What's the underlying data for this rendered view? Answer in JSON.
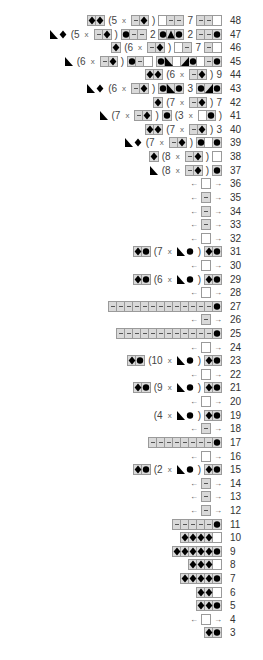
{
  "chart": {
    "symbols": {
      "K": "blank (knit)",
      "P": "dash (purl)",
      "D": "diamond",
      "O": "dot",
      "L": "triangle-left (lower-left black)",
      "R": "triangle-right (lower-right black)",
      "T": "triangle-up"
    },
    "rows": [
      {
        "n": "48",
        "parts": [
          {
            "g": "DD"
          },
          {
            "t": "(5"
          },
          {
            "x": "x"
          },
          {
            "g": "PD"
          },
          {
            "t": ")"
          },
          {
            "g": "KPP"
          },
          {
            "t": "7"
          },
          {
            "g": "PPK"
          }
        ]
      },
      {
        "n": "47",
        "parts": [
          {
            "g": "LD",
            "plain": true
          },
          {
            "t": "(5"
          },
          {
            "x": "x"
          },
          {
            "g": "PD"
          },
          {
            "t": ")"
          },
          {
            "g": "OPP"
          },
          {
            "t": "2"
          },
          {
            "g": "OTO"
          },
          {
            "t": "2"
          },
          {
            "g": "PPO"
          }
        ]
      },
      {
        "n": "46",
        "parts": [
          {
            "g": "D"
          },
          {
            "t": "(6"
          },
          {
            "x": "x"
          },
          {
            "g": "PD"
          },
          {
            "t": ")"
          },
          {
            "g": "KP"
          },
          {
            "t": "7"
          },
          {
            "g": "PK"
          }
        ]
      },
      {
        "n": "45",
        "parts": [
          {
            "g": "L",
            "plain": true
          },
          {
            "t": "(6"
          },
          {
            "x": "x"
          },
          {
            "g": "PD"
          },
          {
            "t": ")"
          },
          {
            "g": "OPK"
          },
          {
            "g": "OLKROKPO"
          }
        ]
      },
      {
        "n": "44",
        "parts": [
          {
            "g": "DD"
          },
          {
            "t": "(6"
          },
          {
            "x": "x"
          },
          {
            "g": "PD"
          },
          {
            "t": ")"
          },
          {
            "t": "9"
          }
        ]
      },
      {
        "n": "43",
        "parts": [
          {
            "g": "LD",
            "plain": true
          },
          {
            "t": "(6"
          },
          {
            "x": "x"
          },
          {
            "g": "PD"
          },
          {
            "t": ")"
          },
          {
            "g": "OLO"
          },
          {
            "t": "3"
          },
          {
            "g": "ORO"
          }
        ]
      },
      {
        "n": "42",
        "parts": [
          {
            "g": "D"
          },
          {
            "t": "(7"
          },
          {
            "x": "x"
          },
          {
            "g": "PD"
          },
          {
            "t": ")"
          },
          {
            "t": "7"
          }
        ]
      },
      {
        "n": "41",
        "parts": [
          {
            "g": "L",
            "plain": true
          },
          {
            "t": "(7"
          },
          {
            "x": "x"
          },
          {
            "g": "PD"
          },
          {
            "t": ")"
          },
          {
            "g": "O"
          },
          {
            "t": "(3"
          },
          {
            "x": "x"
          },
          {
            "g": "KO"
          },
          {
            "t": ")"
          }
        ]
      },
      {
        "n": "40",
        "parts": [
          {
            "g": "DD"
          },
          {
            "t": "(7"
          },
          {
            "x": "x"
          },
          {
            "g": "PD"
          },
          {
            "t": ")"
          },
          {
            "t": "3"
          }
        ]
      },
      {
        "n": "39",
        "parts": [
          {
            "g": "LD",
            "plain": true
          },
          {
            "t": "(7"
          },
          {
            "x": "x"
          },
          {
            "g": "PD"
          },
          {
            "t": ")"
          },
          {
            "g": "OKO"
          }
        ]
      },
      {
        "n": "38",
        "parts": [
          {
            "g": "D"
          },
          {
            "t": "(8"
          },
          {
            "x": "x"
          },
          {
            "g": "PD"
          },
          {
            "t": ")"
          },
          {
            "g": "K"
          }
        ]
      },
      {
        "n": "37",
        "parts": [
          {
            "g": "L",
            "plain": true
          },
          {
            "t": "(8"
          },
          {
            "x": "x"
          },
          {
            "g": "PD"
          },
          {
            "t": ")"
          },
          {
            "g": "O"
          }
        ]
      },
      {
        "n": "36",
        "parts": [
          {
            "a": "←"
          },
          {
            "g": "K"
          },
          {
            "a": "→"
          }
        ]
      },
      {
        "n": "35",
        "parts": [
          {
            "a": "←"
          },
          {
            "g": "P"
          },
          {
            "a": "→"
          }
        ]
      },
      {
        "n": "34",
        "parts": [
          {
            "a": "←"
          },
          {
            "g": "P"
          },
          {
            "a": "→"
          }
        ]
      },
      {
        "n": "33",
        "parts": [
          {
            "a": "←"
          },
          {
            "g": "P"
          },
          {
            "a": "→"
          }
        ]
      },
      {
        "n": "32",
        "parts": [
          {
            "a": "←"
          },
          {
            "g": "K"
          },
          {
            "a": "→"
          }
        ]
      },
      {
        "n": "31",
        "parts": [
          {
            "g": "DO"
          },
          {
            "t": "(7"
          },
          {
            "x": "x"
          },
          {
            "g": "LO",
            "plain": true
          },
          {
            "t": ")"
          },
          {
            "g": "DO"
          }
        ]
      },
      {
        "n": "30",
        "parts": [
          {
            "a": "←"
          },
          {
            "g": "K"
          },
          {
            "a": "→"
          }
        ]
      },
      {
        "n": "29",
        "parts": [
          {
            "g": "DO"
          },
          {
            "t": "(6"
          },
          {
            "x": "x"
          },
          {
            "g": "LO",
            "plain": true
          },
          {
            "t": ")"
          },
          {
            "g": "DO"
          }
        ]
      },
      {
        "n": "28",
        "parts": [
          {
            "a": "←"
          },
          {
            "g": "K"
          },
          {
            "a": "→"
          }
        ]
      },
      {
        "n": "27",
        "parts": [
          {
            "g": "PPPPPPPPPPPPPO"
          }
        ]
      },
      {
        "n": "26",
        "parts": [
          {
            "a": "←"
          },
          {
            "g": "P"
          },
          {
            "a": "→"
          }
        ]
      },
      {
        "n": "25",
        "parts": [
          {
            "g": "PPPPPPPPPPPPO"
          }
        ]
      },
      {
        "n": "24",
        "parts": [
          {
            "a": "←"
          },
          {
            "g": "K"
          },
          {
            "a": "→"
          }
        ]
      },
      {
        "n": "23",
        "parts": [
          {
            "g": "DO"
          },
          {
            "t": "(10"
          },
          {
            "x": "x"
          },
          {
            "g": "LO",
            "plain": true
          },
          {
            "t": ")"
          },
          {
            "g": "DO"
          }
        ]
      },
      {
        "n": "22",
        "parts": [
          {
            "a": "←"
          },
          {
            "g": "K"
          },
          {
            "a": "→"
          }
        ]
      },
      {
        "n": "21",
        "parts": [
          {
            "g": "DO"
          },
          {
            "t": "(9"
          },
          {
            "x": "x"
          },
          {
            "g": "LO",
            "plain": true
          },
          {
            "t": ")"
          },
          {
            "g": "DO"
          }
        ]
      },
      {
        "n": "20",
        "parts": [
          {
            "a": "←"
          },
          {
            "g": "K"
          },
          {
            "a": "→"
          }
        ]
      },
      {
        "n": "19",
        "parts": [
          {
            "t": "(4"
          },
          {
            "x": "x"
          },
          {
            "g": "LO",
            "plain": true
          },
          {
            "t": ")"
          },
          {
            "g": "DO"
          }
        ]
      },
      {
        "n": "18",
        "parts": [
          {
            "a": "←"
          },
          {
            "g": "P"
          },
          {
            "a": "→"
          }
        ]
      },
      {
        "n": "17",
        "parts": [
          {
            "g": "PPPPPPPPO"
          }
        ]
      },
      {
        "n": "16",
        "parts": [
          {
            "a": "←"
          },
          {
            "g": "K"
          },
          {
            "a": "→"
          }
        ]
      },
      {
        "n": "15",
        "parts": [
          {
            "g": "DO"
          },
          {
            "t": "(2"
          },
          {
            "x": "x"
          },
          {
            "g": "LO",
            "plain": true
          },
          {
            "t": ")"
          },
          {
            "g": "DO"
          }
        ]
      },
      {
        "n": "14",
        "parts": [
          {
            "a": "←"
          },
          {
            "g": "P"
          },
          {
            "a": "→"
          }
        ]
      },
      {
        "n": "13",
        "parts": [
          {
            "a": "←"
          },
          {
            "g": "P"
          },
          {
            "a": "→"
          }
        ]
      },
      {
        "n": "12",
        "parts": [
          {
            "a": "←"
          },
          {
            "g": "P"
          },
          {
            "a": "→"
          }
        ]
      },
      {
        "n": "11",
        "parts": [
          {
            "g": "PPPPPO"
          }
        ]
      },
      {
        "n": "10",
        "parts": [
          {
            "g": "DDDDK"
          }
        ]
      },
      {
        "n": "9",
        "parts": [
          {
            "g": "DDDDDO"
          }
        ]
      },
      {
        "n": "8",
        "parts": [
          {
            "g": "DDDK"
          }
        ]
      },
      {
        "n": "7",
        "parts": [
          {
            "g": "DDDDO"
          }
        ]
      },
      {
        "n": "6",
        "parts": [
          {
            "g": "DDK"
          }
        ]
      },
      {
        "n": "5",
        "parts": [
          {
            "g": "DDO"
          }
        ]
      },
      {
        "n": "4",
        "parts": [
          {
            "a": "←"
          },
          {
            "g": "K"
          },
          {
            "a": "→"
          }
        ]
      },
      {
        "n": "3",
        "parts": [
          {
            "g": "DO"
          }
        ]
      }
    ]
  },
  "colors": {
    "ink": "#000000",
    "grid": "#9a9a9a",
    "shade": "#d9d9d9",
    "text": "#444444"
  }
}
